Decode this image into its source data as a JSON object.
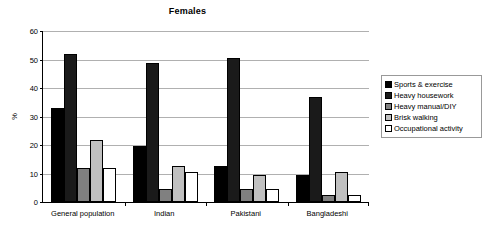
{
  "chart_data": {
    "type": "bar",
    "title": "Females",
    "xlabel": "",
    "ylabel": "%",
    "ylim": [
      0,
      60
    ],
    "yticks": [
      0,
      10,
      20,
      30,
      40,
      50,
      60
    ],
    "grid": true,
    "legend_position": "right",
    "categories": [
      "General population",
      "Indian",
      "Pakistani",
      "Bangladeshi"
    ],
    "series": [
      {
        "name": "Sports & exercise",
        "color": "#000000",
        "values": [
          33,
          19.8,
          12.7,
          9.6
        ]
      },
      {
        "name": "Heavy housework",
        "color": "#1a1a1a",
        "values": [
          52,
          48.8,
          50.7,
          36.7
        ]
      },
      {
        "name": "Heavy manual/DIY",
        "color": "#808080",
        "values": [
          11.8,
          4.7,
          4.6,
          2.5
        ]
      },
      {
        "name": "Brisk walking",
        "color": "#c0c0c0",
        "values": [
          21.9,
          12.7,
          9.6,
          10.6
        ]
      },
      {
        "name": "Occupational activity",
        "color": "#ffffff",
        "values": [
          11.9,
          10.7,
          4.5,
          2.4
        ]
      }
    ]
  },
  "title": {
    "text": "Females"
  },
  "axis": {
    "y_title": "%",
    "y_ticks": [
      "60",
      "50",
      "40",
      "30",
      "20",
      "10",
      "0"
    ]
  },
  "x_labels": [
    "General population",
    "Indian",
    "Pakistani",
    "Bangladeshi"
  ],
  "legend": {
    "items": [
      {
        "label": "Sports & exercise",
        "color": "#000000"
      },
      {
        "label": "Heavy housework",
        "color": "#1a1a1a"
      },
      {
        "label": "Heavy manual/DIY",
        "color": "#808080"
      },
      {
        "label": "Brisk walking",
        "color": "#c0c0c0"
      },
      {
        "label": "Occupational activity",
        "color": "#ffffff"
      }
    ]
  }
}
